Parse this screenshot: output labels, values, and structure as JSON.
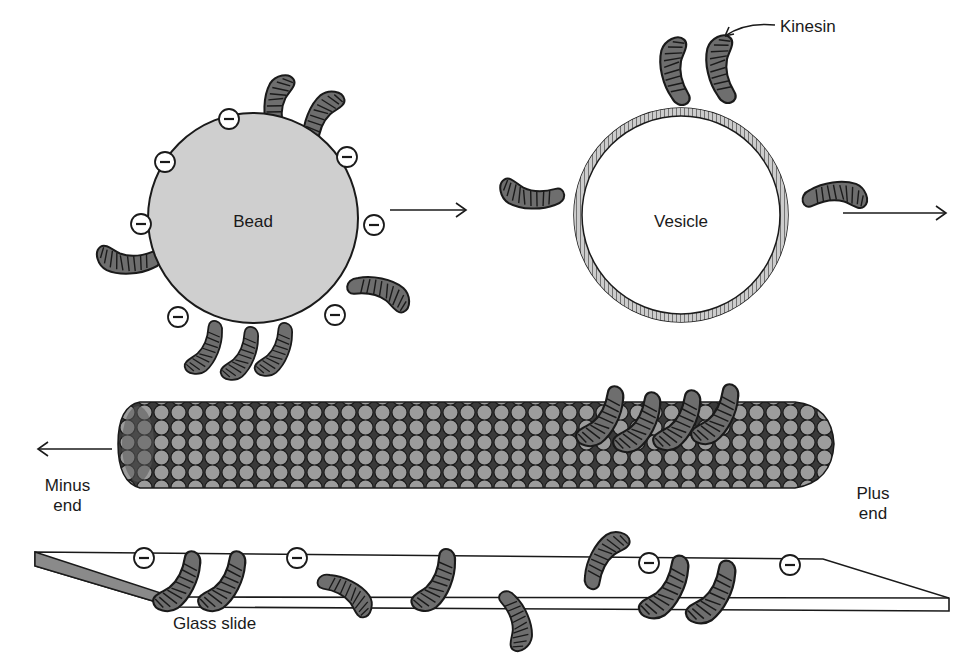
{
  "labels": {
    "bead": "Bead",
    "vesicle": "Vesicle",
    "kinesin": "Kinesin",
    "minus_end_line1": "Minus",
    "minus_end_line2": "end",
    "plus_end_line1": "Plus",
    "plus_end_line2": "end",
    "glass_slide": "Glass slide"
  },
  "symbols": {
    "negative_charge": "−"
  },
  "colors": {
    "motor_fill": "#6e6e6e",
    "tubulin_fill": "#9a9a9a",
    "tubulin_dark": "#5a5a5a",
    "bead_fill": "#cfcfcf",
    "slide_edge": "#8a8a8a",
    "stroke": "#1a1a1a"
  }
}
